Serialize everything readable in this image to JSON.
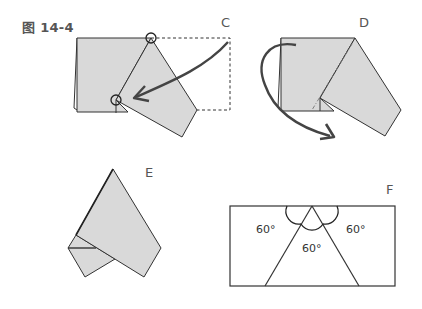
{
  "figure": {
    "title": "图 14-4"
  },
  "panels": {
    "C": {
      "label": "C"
    },
    "D": {
      "label": "D"
    },
    "E": {
      "label": "E"
    },
    "F": {
      "label": "F",
      "angles": [
        "60°",
        "60°",
        "60°"
      ]
    }
  },
  "colors": {
    "paper_fill": "#d9d9d9",
    "stroke": "#333333",
    "arrow": "#444444",
    "label": "#555555"
  }
}
